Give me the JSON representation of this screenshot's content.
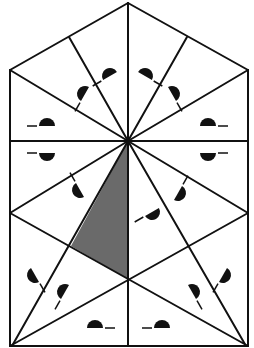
{
  "diagram": {
    "title": "",
    "colors": {
      "stroke": "#111111",
      "shade": "#6a6a6a",
      "background": "#ffffff"
    },
    "lines": [
      [
        10,
        70,
        128,
        3
      ],
      [
        128,
        3,
        248,
        70
      ],
      [
        10,
        70,
        10,
        346
      ],
      [
        248,
        70,
        248,
        346
      ],
      [
        10,
        346,
        248,
        346
      ],
      [
        128,
        3,
        128,
        346
      ],
      [
        10,
        141,
        248,
        141
      ],
      [
        128,
        141,
        10,
        70
      ],
      [
        128,
        141,
        69,
        37
      ],
      [
        128,
        141,
        248,
        70
      ],
      [
        128,
        141,
        187,
        37
      ],
      [
        128,
        141,
        10,
        213
      ],
      [
        128,
        141,
        248,
        213
      ],
      [
        128,
        141,
        12,
        346
      ],
      [
        128,
        141,
        246,
        346
      ],
      [
        10,
        213,
        248,
        346
      ],
      [
        248,
        213,
        10,
        346
      ]
    ],
    "shaded_polygon": [
      [
        128,
        141
      ],
      [
        71,
        246
      ],
      [
        128,
        279
      ]
    ],
    "markers": [
      {
        "x": 47,
        "y": 126,
        "rot": 0
      },
      {
        "x": 208,
        "y": 126,
        "rot": 0,
        "flip": true
      },
      {
        "x": 47,
        "y": 153,
        "rot": 180,
        "flip": true
      },
      {
        "x": 208,
        "y": 153,
        "rot": 180
      },
      {
        "x": 85,
        "y": 94,
        "rot": -60
      },
      {
        "x": 172,
        "y": 94,
        "rot": 60,
        "flip": true
      },
      {
        "x": 110,
        "y": 76,
        "rot": -30
      },
      {
        "x": 145,
        "y": 76,
        "rot": 30,
        "flip": true
      },
      {
        "x": 80,
        "y": 190,
        "rot": 240,
        "flip": true
      },
      {
        "x": 178,
        "y": 193,
        "rot": -240
      },
      {
        "x": 152,
        "y": 212,
        "rot": 150,
        "flip": true
      },
      {
        "x": 35,
        "y": 275,
        "rot": -120
      },
      {
        "x": 223,
        "y": 275,
        "rot": 120,
        "flip": true
      },
      {
        "x": 65,
        "y": 292,
        "rot": -60
      },
      {
        "x": 192,
        "y": 292,
        "rot": 60,
        "flip": true
      },
      {
        "x": 95,
        "y": 328,
        "rot": 0,
        "flip": true
      },
      {
        "x": 162,
        "y": 328,
        "rot": 0
      }
    ]
  }
}
